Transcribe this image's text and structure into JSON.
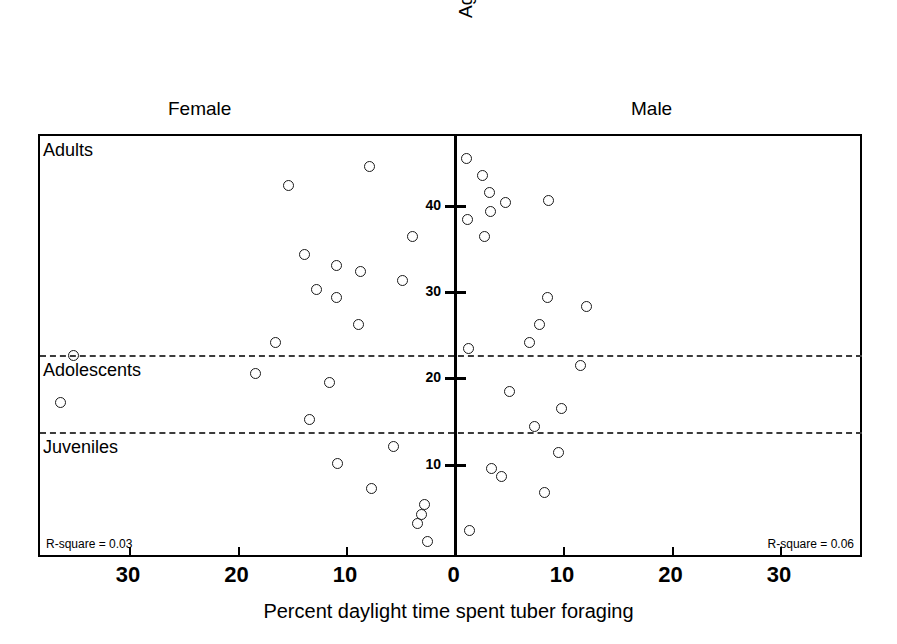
{
  "chart_data": {
    "type": "scatter",
    "title": "",
    "xlabel": "Percent daylight time spent tuber foraging",
    "ylabel": "Age rank",
    "grid": false,
    "legend": "none",
    "axis_style": "back-to-back / mirrored population pyramid scatter",
    "xlim": [
      -35,
      35
    ],
    "ylim": [
      0,
      46
    ],
    "x_tick_labels_left": [
      "30",
      "20",
      "10"
    ],
    "x_tick_label_center": "0",
    "x_tick_labels_right": [
      "10",
      "20",
      "30"
    ],
    "x_tick_values": [
      -30,
      -20,
      -10,
      0,
      10,
      20,
      30
    ],
    "y_tick_labels": [
      "40",
      "30",
      "20",
      "10"
    ],
    "y_tick_values": [
      40,
      30,
      20,
      10
    ],
    "age_bands": [
      {
        "name": "Adults",
        "label": "Adults"
      },
      {
        "name": "Adolescents",
        "label": "Adolescents"
      },
      {
        "name": "Juveniles",
        "label": "Juveniles"
      }
    ],
    "band_dividers": [
      {
        "name": "adults-adolescents-divider",
        "age_rank": 22.6
      },
      {
        "name": "adolescents-juveniles-divider",
        "age_rank": 13.9
      }
    ],
    "series": [
      {
        "name": "Female",
        "label": "Female",
        "side": "left",
        "annotation": "R-square = 0.03",
        "points": [
          {
            "percent": 7.9,
            "age_rank": 44.6
          },
          {
            "percent": 15.4,
            "age_rank": 42.4
          },
          {
            "percent": 4.0,
            "age_rank": 36.5
          },
          {
            "percent": 13.9,
            "age_rank": 34.4
          },
          {
            "percent": 11.0,
            "age_rank": 33.2
          },
          {
            "percent": 8.8,
            "age_rank": 32.4
          },
          {
            "percent": 4.9,
            "age_rank": 31.4
          },
          {
            "percent": 12.8,
            "age_rank": 30.4
          },
          {
            "percent": 11.0,
            "age_rank": 29.4
          },
          {
            "percent": 8.9,
            "age_rank": 26.3
          },
          {
            "percent": 16.6,
            "age_rank": 24.2
          },
          {
            "percent": 35.2,
            "age_rank": 22.7
          },
          {
            "percent": 18.4,
            "age_rank": 20.6
          },
          {
            "percent": 11.6,
            "age_rank": 19.6
          },
          {
            "percent": 36.4,
            "age_rank": 17.3
          },
          {
            "percent": 13.5,
            "age_rank": 15.3
          },
          {
            "percent": 5.7,
            "age_rank": 12.1
          },
          {
            "percent": 10.9,
            "age_rank": 10.2
          },
          {
            "percent": 7.7,
            "age_rank": 7.3
          },
          {
            "percent": 2.9,
            "age_rank": 5.4
          },
          {
            "percent": 3.1,
            "age_rank": 4.3
          },
          {
            "percent": 3.5,
            "age_rank": 3.2
          },
          {
            "percent": 2.6,
            "age_rank": 1.1
          }
        ]
      },
      {
        "name": "Male",
        "label": "Male",
        "side": "right",
        "annotation": "R-square = 0.06",
        "points": [
          {
            "percent": 1.0,
            "age_rank": 45.5
          },
          {
            "percent": 2.5,
            "age_rank": 43.6
          },
          {
            "percent": 3.1,
            "age_rank": 41.6
          },
          {
            "percent": 8.6,
            "age_rank": 40.7
          },
          {
            "percent": 4.6,
            "age_rank": 40.5
          },
          {
            "percent": 3.2,
            "age_rank": 39.4
          },
          {
            "percent": 1.1,
            "age_rank": 38.5
          },
          {
            "percent": 2.7,
            "age_rank": 36.5
          },
          {
            "percent": 8.5,
            "age_rank": 29.4
          },
          {
            "percent": 12.1,
            "age_rank": 28.4
          },
          {
            "percent": 7.7,
            "age_rank": 26.3
          },
          {
            "percent": 6.8,
            "age_rank": 24.2
          },
          {
            "percent": 1.2,
            "age_rank": 23.5
          },
          {
            "percent": 11.5,
            "age_rank": 21.6
          },
          {
            "percent": 5.0,
            "age_rank": 18.5
          },
          {
            "percent": 9.8,
            "age_rank": 16.5
          },
          {
            "percent": 7.3,
            "age_rank": 14.5
          },
          {
            "percent": 9.5,
            "age_rank": 11.5
          },
          {
            "percent": 3.3,
            "age_rank": 9.6
          },
          {
            "percent": 4.2,
            "age_rank": 8.7
          },
          {
            "percent": 8.2,
            "age_rank": 6.8
          },
          {
            "percent": 1.3,
            "age_rank": 2.4
          }
        ]
      }
    ]
  }
}
